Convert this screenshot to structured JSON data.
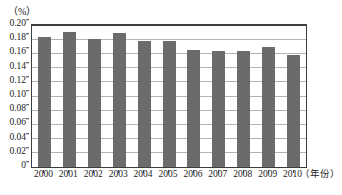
{
  "chart_data": {
    "type": "bar",
    "title": "",
    "unit_label": "（%）",
    "xlabel": "（年份）",
    "ylabel": "",
    "categories": [
      "2000",
      "2001",
      "2002",
      "2003",
      "2004",
      "2005",
      "2006",
      "2007",
      "2008",
      "2009",
      "2010"
    ],
    "values": [
      0.183,
      0.19,
      0.18,
      0.189,
      0.177,
      0.178,
      0.165,
      0.164,
      0.163,
      0.169,
      0.158
    ],
    "ylim": [
      0,
      0.2
    ],
    "y_ticks": [
      "0",
      "0.02",
      "0.04",
      "0.06",
      "0.08",
      "0.10",
      "0.12",
      "0.14",
      "0.16",
      "0.18",
      "0.20"
    ],
    "y_tick_values": [
      0,
      0.02,
      0.04,
      0.06,
      0.08,
      0.1,
      0.12,
      0.14,
      0.16,
      0.18,
      0.2
    ],
    "grid": true,
    "legend": "none",
    "bar_color": "#6b6b6b",
    "grid_color": "#b4b4b4",
    "axis_color": "#3d3d3d"
  }
}
